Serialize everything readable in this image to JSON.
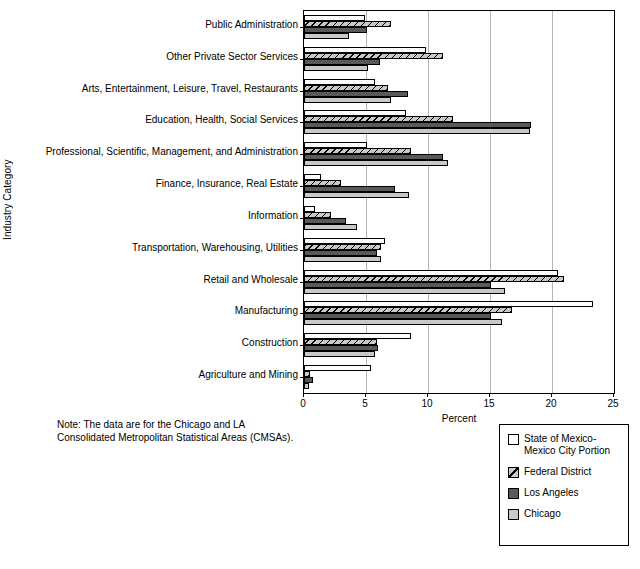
{
  "chart_data": {
    "type": "bar",
    "orientation": "horizontal",
    "title": "",
    "xlabel": "Percent",
    "ylabel": "Industry Category",
    "xlim": [
      0,
      25
    ],
    "xticks": [
      0,
      5,
      10,
      15,
      20,
      25
    ],
    "grid": true,
    "legend_position": "bottom-right",
    "categories": [
      "Public Administration",
      "Other Private Sector Services",
      "Arts, Entertainment, Leisure, Travel, Restaurants",
      "Education, Health, Social Services",
      "Professional, Scientific, Management, and Administration",
      "Finance, Insurance, Real Estate",
      "Information",
      "Transportation, Warehousing, Utilities",
      "Retail and Wholesale",
      "Manufacturing",
      "Construction",
      "Agriculture and Mining"
    ],
    "series": [
      {
        "name": "State of Mexico-Mexico City Portion",
        "pattern": "solid-white",
        "color": "#ffffff",
        "values": [
          4.9,
          9.8,
          5.7,
          8.2,
          5.1,
          1.4,
          0.9,
          6.5,
          20.5,
          23.3,
          8.6,
          5.4
        ]
      },
      {
        "name": "Federal District",
        "pattern": "diagonal-hatch",
        "color": "#c9c9c9",
        "values": [
          7.0,
          11.2,
          6.8,
          12.0,
          8.6,
          3.0,
          2.2,
          6.2,
          21.0,
          16.8,
          5.9,
          0.5
        ]
      },
      {
        "name": "Los Angeles",
        "pattern": "solid-dark-gray",
        "color": "#595959",
        "values": [
          5.1,
          6.1,
          8.4,
          18.3,
          11.2,
          7.3,
          3.4,
          5.9,
          15.1,
          15.1,
          6.0,
          0.7
        ]
      },
      {
        "name": "Chicago",
        "pattern": "solid-light-gray",
        "color": "#c9c9c9",
        "values": [
          3.6,
          5.2,
          7.0,
          18.2,
          11.6,
          8.5,
          4.3,
          6.2,
          16.2,
          16.0,
          5.7,
          0.4
        ]
      }
    ],
    "note": "Note: The data are for the Chicago and LA\nConsolidated Metropolitan Statistical Areas (CMSAs)."
  },
  "legend": {
    "entries": [
      {
        "label": "State of Mexico-\nMexico City Portion"
      },
      {
        "label": "Federal District"
      },
      {
        "label": "Los Angeles"
      },
      {
        "label": "Chicago"
      }
    ]
  }
}
